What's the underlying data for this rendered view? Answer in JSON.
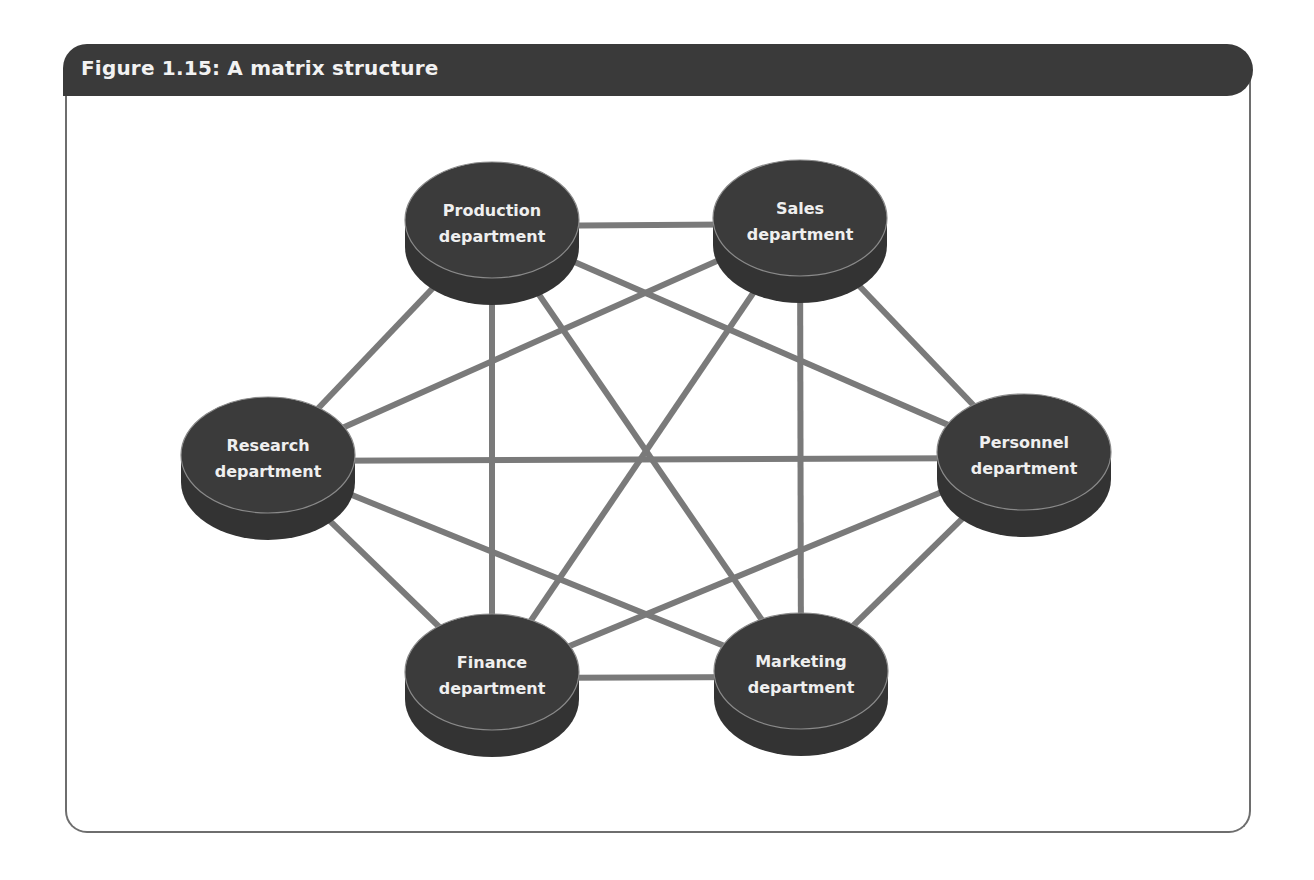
{
  "figure": {
    "title": "Figure 1.15: A matrix structure"
  },
  "colors": {
    "header_bg": "#3a3a3a",
    "node_fill": "#3b3b3b",
    "node_side": "#333333",
    "node_rim": "#8a8a8a",
    "edge": "#7a7a7a",
    "label": "#efefef",
    "frame_border": "#6e6e6e"
  },
  "nodes": [
    {
      "id": "production",
      "line1": "Production",
      "line2": "department",
      "cx": 492,
      "cy": 220
    },
    {
      "id": "sales",
      "line1": "Sales",
      "line2": "department",
      "cx": 800,
      "cy": 218
    },
    {
      "id": "research",
      "line1": "Research",
      "line2": "department",
      "cx": 268,
      "cy": 455
    },
    {
      "id": "personnel",
      "line1": "Personnel",
      "line2": "department",
      "cx": 1024,
      "cy": 452
    },
    {
      "id": "finance",
      "line1": "Finance",
      "line2": "department",
      "cx": 492,
      "cy": 672
    },
    {
      "id": "marketing",
      "line1": "Marketing",
      "line2": "department",
      "cx": 801,
      "cy": 671
    }
  ],
  "edges": [
    [
      "production",
      "sales"
    ],
    [
      "production",
      "research"
    ],
    [
      "production",
      "personnel"
    ],
    [
      "production",
      "finance"
    ],
    [
      "production",
      "marketing"
    ],
    [
      "sales",
      "research"
    ],
    [
      "sales",
      "personnel"
    ],
    [
      "sales",
      "finance"
    ],
    [
      "sales",
      "marketing"
    ],
    [
      "research",
      "personnel"
    ],
    [
      "research",
      "finance"
    ],
    [
      "research",
      "marketing"
    ],
    [
      "personnel",
      "finance"
    ],
    [
      "personnel",
      "marketing"
    ],
    [
      "finance",
      "marketing"
    ]
  ]
}
